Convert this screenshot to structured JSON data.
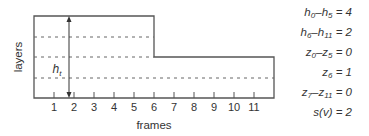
{
  "diagram": {
    "y_axis_label": "layers",
    "x_axis_label": "frames",
    "height_marker": {
      "symbol": "h",
      "subscript": "t"
    },
    "tick_labels": [
      "1",
      "2",
      "3",
      "4",
      "5",
      "6",
      "7",
      "8",
      "9",
      "10",
      "11"
    ],
    "colors": {
      "line": "#555555",
      "dashed": "#666666",
      "text": "#333333"
    }
  },
  "equations": [
    {
      "lhs_a": "h",
      "lhs_a_sub": "0",
      "dash": "–",
      "lhs_b": "h",
      "lhs_b_sub": "5",
      "rhs": " = 4"
    },
    {
      "lhs_a": "h",
      "lhs_a_sub": "6",
      "dash": "–",
      "lhs_b": "h",
      "lhs_b_sub": "11",
      "rhs": " = 2"
    },
    {
      "lhs_a": "z",
      "lhs_a_sub": "0",
      "dash": "–",
      "lhs_b": "z",
      "lhs_b_sub": "5",
      "rhs": " = 0"
    },
    {
      "lhs_a": "z",
      "lhs_a_sub": "6",
      "dash": "",
      "lhs_b": "",
      "lhs_b_sub": "",
      "rhs": " = 1"
    },
    {
      "lhs_a": "z",
      "lhs_a_sub": "7",
      "dash": "–",
      "lhs_b": "z",
      "lhs_b_sub": "11",
      "rhs": " = 0"
    },
    {
      "lhs_a": "s(v)",
      "lhs_a_sub": "",
      "dash": "",
      "lhs_b": "",
      "lhs_b_sub": "",
      "rhs": " = 2"
    }
  ]
}
